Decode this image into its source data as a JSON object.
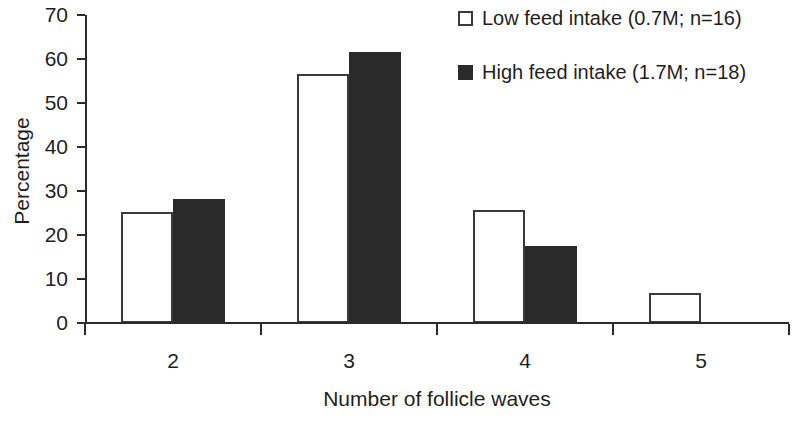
{
  "chart_data": {
    "type": "bar",
    "title": "",
    "xlabel": "Number of follicle waves",
    "ylabel": "Percentage",
    "categories": [
      "2",
      "3",
      "4",
      "5"
    ],
    "series": [
      {
        "name": "Low feed intake (0.7M; n=16)",
        "marker": "open-square",
        "color": "#ffffff",
        "edge_color": "#3a3a3a",
        "values": [
          25.3,
          56.6,
          25.7,
          6.8
        ]
      },
      {
        "name": "High feed intake (1.7M; n=18)",
        "marker": "filled-square",
        "color": "#2a2a2a",
        "edge_color": "#2a2a2a",
        "values": [
          28.1,
          61.7,
          17.4,
          0
        ]
      }
    ],
    "ylim": [
      0,
      70
    ],
    "y_ticks": [
      0,
      10,
      20,
      30,
      40,
      50,
      60,
      70
    ],
    "y_tick_labels": [
      "0",
      "10",
      "20",
      "30",
      "40",
      "50",
      "60",
      "70"
    ],
    "grid": false,
    "legend_position": "top-right"
  },
  "axes": {
    "y_title": "Percentage",
    "x_title": "Number of follicle waves"
  },
  "legend": {
    "items": [
      {
        "label": "Low feed intake (0.7M; n=16)",
        "style": "low"
      },
      {
        "label": "High feed intake (1.7M; n=18)",
        "style": "high"
      }
    ]
  }
}
